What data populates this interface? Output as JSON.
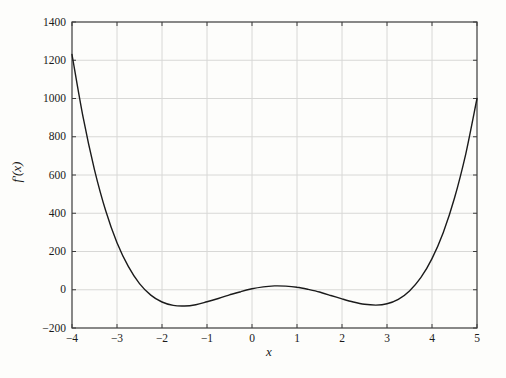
{
  "figure": {
    "background": "#fdfdfb",
    "frame_color": "#3b3b3b",
    "grid_color": "#d8d8d6",
    "tick_color": "#3b3b3b",
    "curve_color": "#1b1b1b",
    "text_color": "#1a1a1a"
  },
  "chart_data": {
    "type": "line",
    "title": "",
    "xlabel": "x",
    "ylabel": "f′(x)",
    "xlim": [
      -4,
      5
    ],
    "ylim": [
      -200,
      1400
    ],
    "xticks": [
      -4,
      -3,
      -2,
      -1,
      0,
      1,
      2,
      3,
      4,
      5
    ],
    "yticks": [
      -200,
      0,
      200,
      400,
      600,
      800,
      1000,
      1200,
      1400
    ],
    "grid": true,
    "legend_position": "none",
    "series": [
      {
        "name": "f'(x)",
        "points": [
          [
            -4.0,
            1230
          ],
          [
            -3.75,
            897
          ],
          [
            -3.5,
            627
          ],
          [
            -3.25,
            412
          ],
          [
            -3.0,
            246
          ],
          [
            -2.75,
            122
          ],
          [
            -2.5,
            32
          ],
          [
            -2.25,
            -28
          ],
          [
            -2.0,
            -64
          ],
          [
            -1.75,
            -82
          ],
          [
            -1.5,
            -85
          ],
          [
            -1.25,
            -78
          ],
          [
            -1.0,
            -63
          ],
          [
            -0.75,
            -46
          ],
          [
            -0.5,
            -27
          ],
          [
            -0.25,
            -10
          ],
          [
            0.0,
            5
          ],
          [
            0.25,
            15
          ],
          [
            0.5,
            20
          ],
          [
            0.75,
            19
          ],
          [
            1.0,
            13
          ],
          [
            1.25,
            2
          ],
          [
            1.5,
            -12
          ],
          [
            1.75,
            -30
          ],
          [
            2.0,
            -48
          ],
          [
            2.25,
            -64
          ],
          [
            2.5,
            -76
          ],
          [
            2.75,
            -80
          ],
          [
            3.0,
            -73
          ],
          [
            3.25,
            -50
          ],
          [
            3.5,
            -6
          ],
          [
            3.75,
            63
          ],
          [
            4.0,
            163
          ],
          [
            4.25,
            300
          ],
          [
            4.5,
            480
          ],
          [
            4.75,
            711
          ],
          [
            5.0,
            1000
          ]
        ]
      }
    ]
  }
}
